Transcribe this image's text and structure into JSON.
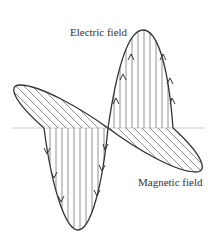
{
  "diagram": {
    "labels": {
      "electric": "Electric field",
      "magnetic": "Magnetic field"
    },
    "colors": {
      "outline": "#333333",
      "hatch": "#777777",
      "axis": "#cccccc"
    }
  }
}
